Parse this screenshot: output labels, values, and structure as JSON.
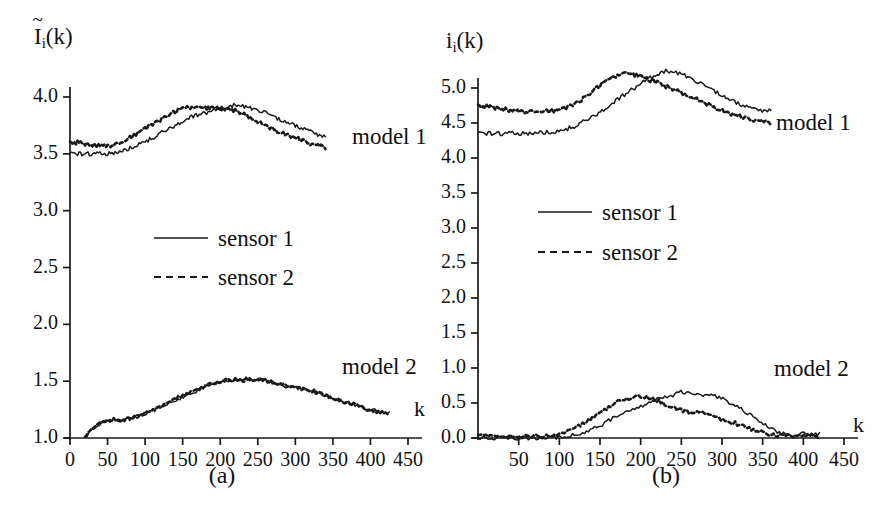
{
  "figure": {
    "background": "#ffffff",
    "ink_color": "#1a1a1a"
  },
  "panels": [
    {
      "id": "a",
      "caption": "(a)",
      "ylabel_base": "I",
      "ylabel_sub": "i",
      "ylabel_arg": "(k)",
      "ylabel_accent": "~",
      "xlabel": "k",
      "annotations": [
        {
          "name": "model-1-label",
          "text": "model 1"
        },
        {
          "name": "model-2-label",
          "text": "model 2"
        }
      ],
      "legend": [
        {
          "label": "sensor 1",
          "style": "solid"
        },
        {
          "label": "sensor 2",
          "style": "dashed"
        }
      ]
    },
    {
      "id": "b",
      "caption": "(b)",
      "ylabel_base": "i",
      "ylabel_sub": "i",
      "ylabel_arg": "(k)",
      "ylabel_accent": "",
      "xlabel": "k",
      "annotations": [
        {
          "name": "model-1-label",
          "text": "model 1"
        },
        {
          "name": "model-2-label",
          "text": "model 2"
        }
      ],
      "legend": [
        {
          "label": "sensor 1",
          "style": "solid"
        },
        {
          "label": "sensor 2",
          "style": "dashed"
        }
      ]
    }
  ],
  "chart_data": [
    {
      "type": "line",
      "panel": "a",
      "title": "",
      "xlabel": "k",
      "ylabel": "I~_i(k)",
      "xlim": [
        0,
        450
      ],
      "ylim": [
        1.0,
        4.0
      ],
      "xticks": [
        0,
        50,
        100,
        150,
        200,
        250,
        300,
        350,
        400,
        450
      ],
      "xticklabels": [
        "0",
        "50",
        "100",
        "150",
        "200",
        "250",
        "300",
        "350",
        "400",
        "450"
      ],
      "yticks": [
        1.0,
        1.5,
        2.0,
        2.5,
        3.0,
        3.5,
        4.0
      ],
      "yticklabels": [
        "1.0",
        "1.5",
        "2.0",
        "2.5",
        "3.0",
        "3.5",
        "4.0"
      ],
      "grid": false,
      "legend_position": "center-left",
      "groups": [
        {
          "name": "model 1",
          "series": [
            {
              "name": "sensor 1",
              "style": "solid",
              "x": [
                0,
                10,
                20,
                30,
                40,
                50,
                60,
                70,
                80,
                90,
                100,
                110,
                120,
                130,
                140,
                150,
                160,
                170,
                180,
                190,
                200,
                210,
                220,
                230,
                240,
                250,
                260,
                270,
                280,
                290,
                300,
                310,
                320,
                330,
                340
              ],
              "y": [
                3.5,
                3.5,
                3.5,
                3.5,
                3.5,
                3.5,
                3.51,
                3.52,
                3.55,
                3.58,
                3.61,
                3.64,
                3.68,
                3.71,
                3.75,
                3.79,
                3.82,
                3.84,
                3.86,
                3.88,
                3.89,
                3.91,
                3.93,
                3.92,
                3.9,
                3.88,
                3.86,
                3.83,
                3.8,
                3.78,
                3.75,
                3.72,
                3.7,
                3.67,
                3.65
              ]
            },
            {
              "name": "sensor 2",
              "style": "dashed",
              "x": [
                0,
                10,
                20,
                30,
                40,
                50,
                60,
                70,
                80,
                90,
                100,
                110,
                120,
                130,
                140,
                150,
                160,
                170,
                180,
                190,
                200,
                210,
                220,
                230,
                240,
                250,
                260,
                270,
                280,
                290,
                300,
                310,
                320,
                330,
                340
              ],
              "y": [
                3.6,
                3.6,
                3.59,
                3.58,
                3.57,
                3.57,
                3.58,
                3.6,
                3.64,
                3.68,
                3.72,
                3.76,
                3.8,
                3.84,
                3.87,
                3.9,
                3.91,
                3.9,
                3.9,
                3.9,
                3.9,
                3.89,
                3.88,
                3.85,
                3.82,
                3.78,
                3.75,
                3.72,
                3.69,
                3.67,
                3.64,
                3.62,
                3.59,
                3.57,
                3.56
              ]
            }
          ]
        },
        {
          "name": "model 2",
          "series": [
            {
              "name": "sensor 1",
              "style": "solid",
              "x": [
                20,
                30,
                40,
                50,
                60,
                70,
                80,
                90,
                100,
                110,
                120,
                130,
                140,
                150,
                160,
                170,
                180,
                190,
                200,
                210,
                220,
                230,
                240,
                250,
                260,
                270,
                280,
                290,
                300,
                310,
                320,
                330,
                340,
                350,
                360,
                370,
                380,
                390,
                400,
                410,
                420,
                425
              ],
              "y": [
                1.0,
                1.08,
                1.13,
                1.15,
                1.16,
                1.16,
                1.17,
                1.19,
                1.21,
                1.24,
                1.27,
                1.3,
                1.33,
                1.36,
                1.39,
                1.42,
                1.45,
                1.47,
                1.49,
                1.5,
                1.51,
                1.51,
                1.51,
                1.52,
                1.51,
                1.49,
                1.47,
                1.45,
                1.44,
                1.43,
                1.42,
                1.4,
                1.38,
                1.35,
                1.33,
                1.31,
                1.29,
                1.27,
                1.25,
                1.23,
                1.22,
                1.22
              ]
            },
            {
              "name": "sensor 2",
              "style": "dashed",
              "x": [
                20,
                30,
                40,
                50,
                60,
                70,
                80,
                90,
                100,
                110,
                120,
                130,
                140,
                150,
                160,
                170,
                180,
                190,
                200,
                210,
                220,
                230,
                240,
                250,
                260,
                270,
                280,
                290,
                300,
                310,
                320,
                330,
                340,
                350,
                360,
                370,
                380,
                390,
                400,
                410,
                420,
                425
              ],
              "y": [
                1.0,
                1.08,
                1.13,
                1.15,
                1.16,
                1.16,
                1.17,
                1.19,
                1.22,
                1.25,
                1.28,
                1.31,
                1.34,
                1.37,
                1.4,
                1.43,
                1.46,
                1.48,
                1.5,
                1.51,
                1.51,
                1.51,
                1.52,
                1.52,
                1.51,
                1.49,
                1.47,
                1.45,
                1.44,
                1.43,
                1.42,
                1.4,
                1.38,
                1.35,
                1.33,
                1.31,
                1.29,
                1.27,
                1.25,
                1.23,
                1.22,
                1.22
              ]
            }
          ]
        }
      ]
    },
    {
      "type": "line",
      "panel": "b",
      "title": "",
      "xlabel": "k",
      "ylabel": "i_i(k)",
      "xlim": [
        0,
        450
      ],
      "ylim": [
        0.0,
        5.0
      ],
      "xticks": [
        50,
        100,
        150,
        200,
        250,
        300,
        350,
        400,
        450
      ],
      "xticklabels": [
        "50",
        "100",
        "150",
        "200",
        "250",
        "300",
        "350",
        "400",
        "450"
      ],
      "yticks": [
        0.0,
        0.5,
        1.0,
        1.5,
        2.0,
        2.5,
        3.0,
        3.5,
        4.0,
        4.5,
        5.0
      ],
      "yticklabels": [
        "0.0",
        "0.5",
        "1.0",
        "1.5",
        "2.0",
        "2.5",
        "3.0",
        "3.5",
        "4.0",
        "4.5",
        "5.0"
      ],
      "grid": false,
      "legend_position": "center-left",
      "groups": [
        {
          "name": "model 1",
          "series": [
            {
              "name": "sensor 1",
              "style": "solid",
              "x": [
                0,
                20,
                40,
                60,
                80,
                100,
                110,
                120,
                130,
                140,
                150,
                160,
                170,
                180,
                190,
                200,
                210,
                220,
                230,
                240,
                250,
                260,
                270,
                280,
                290,
                300,
                310,
                320,
                330,
                340,
                350,
                360
              ],
              "y": [
                4.35,
                4.35,
                4.35,
                4.35,
                4.36,
                4.38,
                4.42,
                4.46,
                4.52,
                4.58,
                4.66,
                4.74,
                4.82,
                4.9,
                4.98,
                5.06,
                5.13,
                5.2,
                5.24,
                5.23,
                5.2,
                5.14,
                5.08,
                5.02,
                4.96,
                4.9,
                4.84,
                4.78,
                4.73,
                4.7,
                4.68,
                4.68
              ]
            },
            {
              "name": "sensor 2",
              "style": "dashed",
              "x": [
                0,
                20,
                40,
                60,
                80,
                100,
                110,
                120,
                130,
                140,
                150,
                160,
                170,
                180,
                190,
                200,
                210,
                220,
                230,
                240,
                250,
                260,
                270,
                280,
                290,
                300,
                310,
                320,
                330,
                340,
                350,
                360
              ],
              "y": [
                4.75,
                4.72,
                4.68,
                4.66,
                4.66,
                4.68,
                4.72,
                4.78,
                4.86,
                4.95,
                5.04,
                5.12,
                5.18,
                5.2,
                5.19,
                5.16,
                5.12,
                5.08,
                5.03,
                4.98,
                4.93,
                4.88,
                4.83,
                4.78,
                4.73,
                4.68,
                4.64,
                4.6,
                4.57,
                4.54,
                4.52,
                4.5
              ]
            }
          ]
        },
        {
          "name": "model 2",
          "series": [
            {
              "name": "sensor 1",
              "style": "solid",
              "x": [
                0,
                40,
                80,
                100,
                110,
                120,
                130,
                140,
                150,
                160,
                170,
                180,
                190,
                200,
                210,
                220,
                230,
                240,
                250,
                260,
                270,
                280,
                290,
                300,
                310,
                320,
                330,
                340,
                350,
                360,
                370,
                380,
                390,
                400,
                410,
                420
              ],
              "y": [
                0.0,
                0.0,
                0.0,
                0.01,
                0.02,
                0.04,
                0.08,
                0.13,
                0.18,
                0.24,
                0.3,
                0.35,
                0.4,
                0.45,
                0.5,
                0.55,
                0.59,
                0.62,
                0.67,
                0.64,
                0.63,
                0.62,
                0.6,
                0.56,
                0.5,
                0.44,
                0.37,
                0.3,
                0.22,
                0.14,
                0.08,
                0.05,
                0.05,
                0.06,
                0.06,
                0.06
              ]
            },
            {
              "name": "sensor 2",
              "style": "dashed",
              "x": [
                0,
                20,
                40,
                60,
                80,
                100,
                110,
                120,
                130,
                140,
                150,
                160,
                170,
                180,
                190,
                200,
                210,
                220,
                230,
                240,
                250,
                260,
                270,
                280,
                290,
                300,
                310,
                320,
                330,
                340,
                350,
                360,
                370,
                380,
                390,
                400,
                410,
                420
              ],
              "y": [
                0.03,
                0.02,
                0.02,
                0.02,
                0.02,
                0.06,
                0.1,
                0.15,
                0.2,
                0.28,
                0.36,
                0.44,
                0.51,
                0.56,
                0.58,
                0.59,
                0.57,
                0.54,
                0.49,
                0.44,
                0.4,
                0.37,
                0.36,
                0.34,
                0.3,
                0.26,
                0.23,
                0.2,
                0.16,
                0.12,
                0.08,
                0.05,
                0.03,
                0.03,
                0.04,
                0.04,
                0.03,
                0.02
              ]
            }
          ]
        }
      ]
    }
  ]
}
